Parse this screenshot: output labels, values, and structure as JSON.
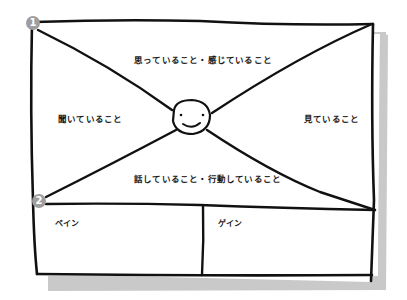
{
  "diagram": {
    "type": "empathy-map",
    "colors": {
      "stroke": "#111111",
      "shadow": "#c9c9c9",
      "badge": "#9e9e9e",
      "background": "#ffffff"
    },
    "badges": [
      {
        "number": "1",
        "position": "top-left"
      },
      {
        "number": "2",
        "position": "middle-left"
      }
    ],
    "quadrants": {
      "top": "思っていること・感じていること",
      "left": "聞いていること",
      "right": "見ていること",
      "bottom": "話していること・行動していること"
    },
    "center": {
      "icon": "smiley-face"
    },
    "bottom_panels": {
      "left": "ペイン",
      "right": "ゲイン"
    }
  }
}
